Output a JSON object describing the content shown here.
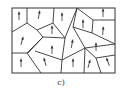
{
  "figure": {
    "caption": "c)",
    "line_color": "#333333",
    "frame": {
      "x": 12,
      "y": 8,
      "w": 103,
      "h": 65
    },
    "boundaries": [
      [
        [
          27,
          8
        ],
        [
          27,
          23
        ],
        [
          12,
          32
        ]
      ],
      [
        [
          27,
          23
        ],
        [
          37,
          30
        ],
        [
          53,
          23
        ],
        [
          54,
          8
        ]
      ],
      [
        [
          53,
          23
        ],
        [
          65,
          38
        ],
        [
          77,
          8
        ]
      ],
      [
        [
          77,
          8
        ],
        [
          93,
          20
        ],
        [
          115,
          20
        ]
      ],
      [
        [
          37,
          30
        ],
        [
          43,
          37
        ],
        [
          27,
          53
        ],
        [
          12,
          53
        ]
      ],
      [
        [
          43,
          37
        ],
        [
          65,
          38
        ]
      ],
      [
        [
          27,
          53
        ],
        [
          41,
          73
        ]
      ],
      [
        [
          77,
          8
        ],
        [
          73,
          27
        ],
        [
          85,
          48
        ],
        [
          115,
          44
        ]
      ],
      [
        [
          93,
          20
        ],
        [
          92,
          33
        ],
        [
          73,
          27
        ]
      ],
      [
        [
          92,
          33
        ],
        [
          115,
          44
        ]
      ],
      [
        [
          65,
          38
        ],
        [
          62,
          60
        ],
        [
          85,
          48
        ]
      ],
      [
        [
          43,
          37
        ],
        [
          28,
          53
        ]
      ],
      [
        [
          62,
          60
        ],
        [
          61,
          73
        ]
      ],
      [
        [
          62,
          60
        ],
        [
          35,
          51
        ]
      ],
      [
        [
          85,
          48
        ],
        [
          96,
          58
        ],
        [
          101,
          73
        ]
      ],
      [
        [
          85,
          48
        ],
        [
          84,
          73
        ]
      ],
      [
        [
          96,
          58
        ],
        [
          115,
          55
        ]
      ]
    ],
    "arrows": [
      {
        "x": 19,
        "y": 16,
        "angle": 0
      },
      {
        "x": 39,
        "y": 15,
        "angle": 10
      },
      {
        "x": 62,
        "y": 17,
        "angle": 0
      },
      {
        "x": 83,
        "y": 24,
        "angle": 0
      },
      {
        "x": 103,
        "y": 13,
        "angle": 0
      },
      {
        "x": 103,
        "y": 31,
        "angle": 5
      },
      {
        "x": 22,
        "y": 41,
        "angle": 15
      },
      {
        "x": 52,
        "y": 30,
        "angle": 0
      },
      {
        "x": 72,
        "y": 44,
        "angle": 10
      },
      {
        "x": 52,
        "y": 50,
        "angle": 0
      },
      {
        "x": 96,
        "y": 47,
        "angle": 0
      },
      {
        "x": 21,
        "y": 63,
        "angle": 0
      },
      {
        "x": 45,
        "y": 62,
        "angle": -15
      },
      {
        "x": 73,
        "y": 63,
        "angle": 0
      },
      {
        "x": 89,
        "y": 64,
        "angle": 15
      },
      {
        "x": 108,
        "y": 62,
        "angle": -20
      }
    ]
  }
}
